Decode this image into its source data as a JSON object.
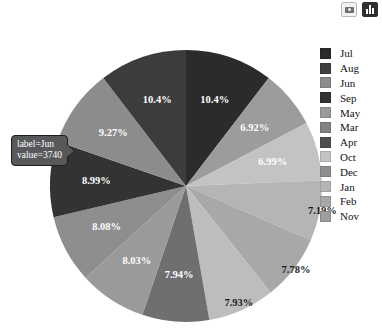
{
  "toolbar": {
    "screenshot_icon": "camera-icon",
    "chart_icon": "bar-chart-icon"
  },
  "tooltip": {
    "visible": true,
    "label_line": "label=Jun",
    "value_line": "value=3740"
  },
  "legend": {
    "position": "right",
    "items": [
      {
        "label": "Jul",
        "color": "#2b2b2b"
      },
      {
        "label": "Aug",
        "color": "#404040"
      },
      {
        "label": "Jun",
        "color": "#8c8c8c"
      },
      {
        "label": "Sep",
        "color": "#333333"
      },
      {
        "label": "May",
        "color": "#9a9a9a"
      },
      {
        "label": "Mar",
        "color": "#828282"
      },
      {
        "label": "Apr",
        "color": "#4f4f4f"
      },
      {
        "label": "Oct",
        "color": "#c3c3c3"
      },
      {
        "label": "Dec",
        "color": "#8f8f8f"
      },
      {
        "label": "Jan",
        "color": "#b5b5b5"
      },
      {
        "label": "Feb",
        "color": "#a8a8a8"
      },
      {
        "label": "Nov",
        "color": "#9e9e9e"
      }
    ]
  },
  "chart_data": {
    "type": "pie",
    "title": "",
    "legend_position": "right",
    "grid": false,
    "hovered_slice": {
      "label": "Jun",
      "value": 3740
    },
    "categories": [
      "Jul",
      "Aug",
      "Jun",
      "Sep",
      "May",
      "Mar",
      "Apr",
      "Oct",
      "Dec",
      "Jan",
      "Feb",
      "Nov"
    ],
    "percent_labels": [
      "10.4%",
      "6.92%",
      "6.99%",
      "7.19%",
      "7.78%",
      "7.93%",
      "7.94%",
      "8.03%",
      "8.08%",
      "8.99%",
      "9.27%",
      "10.4%"
    ],
    "slices": [
      {
        "label": "Jul",
        "percent": 10.4,
        "percent_label": "10.4%",
        "color": "#2b2b2b",
        "order_clockwise": 1
      },
      {
        "label": "Aug",
        "percent": 6.92,
        "percent_label": "6.92%",
        "color": "#9c9c9c",
        "order_clockwise": 2
      },
      {
        "label": "Oct",
        "percent": 6.99,
        "percent_label": "6.99%",
        "color": "#c3c3c3",
        "order_clockwise": 3
      },
      {
        "label": "Jan",
        "percent": 7.19,
        "percent_label": "7.19%",
        "color": "#b5b5b5",
        "order_clockwise": 4
      },
      {
        "label": "Feb",
        "percent": 7.78,
        "percent_label": "7.78%",
        "color": "#a8a8a8",
        "order_clockwise": 5
      },
      {
        "label": "Nov",
        "percent": 7.93,
        "percent_label": "7.93%",
        "color": "#bdbdbd",
        "order_clockwise": 6
      },
      {
        "label": "Apr",
        "percent": 7.94,
        "percent_label": "7.94%",
        "color": "#6f6f6f",
        "order_clockwise": 7
      },
      {
        "label": "Dec",
        "percent": 8.03,
        "percent_label": "8.03%",
        "color": "#9a9a9a",
        "order_clockwise": 8
      },
      {
        "label": "Mar",
        "percent": 8.08,
        "percent_label": "8.08%",
        "color": "#8e8e8e",
        "order_clockwise": 9
      },
      {
        "label": "Sep",
        "percent": 8.99,
        "percent_label": "8.99%",
        "color": "#333333",
        "order_clockwise": 10
      },
      {
        "label": "Jun",
        "percent": 9.27,
        "percent_label": "9.27%",
        "color": "#8c8c8c",
        "order_clockwise": 11
      },
      {
        "label": "May",
        "percent": 10.4,
        "percent_label": "10.4%",
        "color": "#3c3c3c",
        "order_clockwise": 12
      }
    ]
  },
  "colors": {
    "background": "#ffffff",
    "tooltip_background": "#57585a",
    "tooltip_border": "#1d1d1f",
    "tooltip_text": "#ffffff",
    "label_text": "#141414"
  }
}
